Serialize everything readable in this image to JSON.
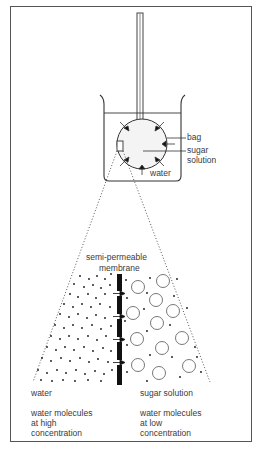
{
  "diagram": {
    "type": "osmosis illustration",
    "beaker_labels": {
      "bag": "bag",
      "sugar_solution_line1": "sugar",
      "sugar_solution_line2": "solution",
      "water": "water"
    },
    "membrane_label": {
      "line1": "semi-permeable",
      "line2": "membrane"
    },
    "side_labels": {
      "left": "water",
      "right": "sugar solution"
    },
    "descriptions": {
      "left": [
        "water molecules",
        "at high",
        "concentration"
      ],
      "right": [
        "water molecules",
        "at low",
        "concentration"
      ]
    },
    "colors": {
      "stroke": "#333333",
      "frame": "#555555",
      "membrane": "#111111",
      "bag_fill": "#f4f4f4"
    }
  }
}
